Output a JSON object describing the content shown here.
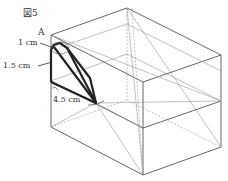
{
  "figure": {
    "title": "図5",
    "labels": {
      "point_a": "A",
      "len_1": "1 cm",
      "len_2": "1.5 cm",
      "len_3": "4.5 cm"
    }
  },
  "colors": {
    "edge": "#555555",
    "hidden": "#888888",
    "bold": "#222222",
    "text": "#333333"
  }
}
